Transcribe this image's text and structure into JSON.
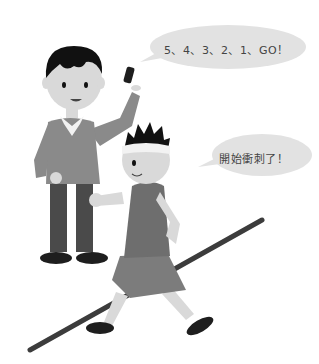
{
  "illustration": {
    "description": "Grayscale cartoon of a teacher starting a race and a boy sprinting",
    "speech_bubbles": [
      {
        "speaker": "teacher",
        "text": "5、4、3、2、1、GO！"
      },
      {
        "speaker": "runner",
        "text": "開始衝刺了！"
      }
    ],
    "colors": {
      "background": "#ffffff",
      "bubble": "#e2e2e2",
      "skin": "#d9d9d9",
      "hair": "#111111",
      "shirt": "#8a8a8a",
      "pants": "#4a4a4a",
      "shoes": "#1e1e1e",
      "line": "#3c3c3c",
      "collar": "#f2f2f2",
      "shorts": "#7c7c7c",
      "tank": "#6e6e6e"
    }
  }
}
